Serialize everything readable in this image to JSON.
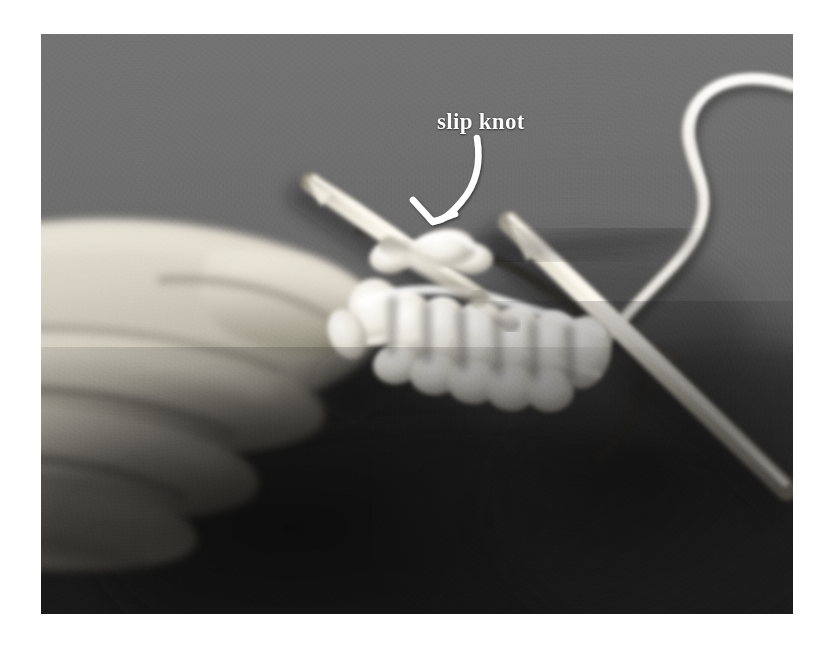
{
  "page": {
    "background_color": "#ffffff",
    "width": 836,
    "height": 648
  },
  "photo": {
    "kind": "photograph",
    "color_mode": "grayscale",
    "subject": "A left hand holding two knitting needles with white yarn stitches cast on, on a grey cloth background",
    "frame": {
      "left": 41,
      "top": 34,
      "width": 752,
      "height": 580
    },
    "backdrop_color": "#6d6d6d",
    "shadow_color": "#222222",
    "yarn_color": "#f2f0ea",
    "needle_color": "#ece7d9",
    "skin_color": "#d8d2c6"
  },
  "annotations": [
    {
      "id": "slip-knot",
      "label": "slip knot",
      "text_color": "#fbfbfb",
      "arrow_color": "#ffffff",
      "arrow": {
        "from": {
          "x": 475,
          "y": 140
        },
        "to": {
          "x": 444,
          "y": 219
        },
        "style": "curved-with-arrowhead"
      }
    }
  ],
  "elements": {
    "needle_left_label": "knitting-needle-left",
    "needle_right_label": "knitting-needle-right",
    "yarn_strand_label": "working-yarn-strand",
    "stitches_label": "cast-on-stitches",
    "hand_label": "hand-holding-needles"
  }
}
